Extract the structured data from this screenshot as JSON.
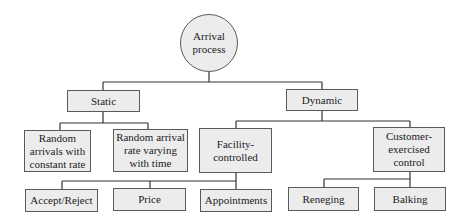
{
  "diagram": {
    "type": "tree",
    "colors": {
      "node_fill": "#ececec",
      "node_border": "#5a5a5a",
      "edge": "#333333",
      "text": "#222222"
    },
    "root": {
      "id": "arrival",
      "label": "Arrival\nprocess",
      "shape": "circle"
    },
    "nodes": {
      "static": {
        "label": "Static"
      },
      "dynamic": {
        "label": "Dynamic"
      },
      "random_constant": {
        "label": "Random\narrivals with\nconstant rate"
      },
      "random_varying": {
        "label": "Random arrival\nrate varying\nwith time"
      },
      "facility": {
        "label": "Facility-\ncontrolled"
      },
      "customer": {
        "label": "Customer-\nexercised\ncontrol"
      },
      "accept_reject": {
        "label": "Accept/Reject"
      },
      "price": {
        "label": "Price"
      },
      "appointments": {
        "label": "Appointments"
      },
      "reneging": {
        "label": "Reneging"
      },
      "balking": {
        "label": "Balking"
      }
    },
    "edges": [
      [
        "arrival",
        "static"
      ],
      [
        "arrival",
        "dynamic"
      ],
      [
        "static",
        "random_constant"
      ],
      [
        "static",
        "random_varying"
      ],
      [
        "dynamic",
        "facility"
      ],
      [
        "dynamic",
        "customer"
      ],
      [
        "facility",
        "accept_reject"
      ],
      [
        "facility",
        "price"
      ],
      [
        "facility",
        "appointments"
      ],
      [
        "customer",
        "reneging"
      ],
      [
        "customer",
        "balking"
      ]
    ]
  }
}
